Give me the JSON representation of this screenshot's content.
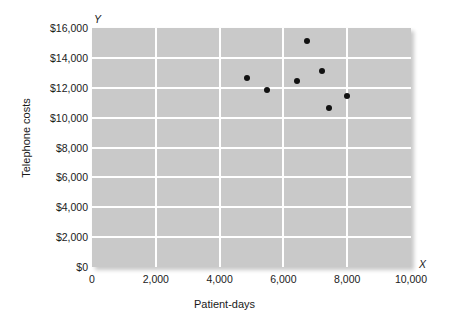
{
  "chart_data": {
    "type": "scatter",
    "title": "",
    "xlabel": "Patient-days",
    "ylabel": "Telephone costs",
    "x_axis_letter": "X",
    "y_axis_letter": "Y",
    "xlim": [
      0,
      10000
    ],
    "ylim": [
      0,
      16000
    ],
    "grid": true,
    "legend": null,
    "x_ticks": [
      0,
      2000,
      4000,
      6000,
      8000,
      10000
    ],
    "y_ticks": [
      0,
      2000,
      4000,
      6000,
      8000,
      10000,
      12000,
      14000,
      16000
    ],
    "x_tick_labels": [
      "0",
      "2,000",
      "4,000",
      "6,000",
      "8,000",
      "10,000"
    ],
    "y_tick_labels": [
      "$0",
      "$2,000",
      "$4,000",
      "$6,000",
      "$8,000",
      "$10,000",
      "$12,000",
      "$14,000",
      "$16,000"
    ],
    "points": [
      {
        "x": 4860,
        "y": 12650
      },
      {
        "x": 5490,
        "y": 11850
      },
      {
        "x": 6430,
        "y": 12450
      },
      {
        "x": 6740,
        "y": 15100
      },
      {
        "x": 7210,
        "y": 13150
      },
      {
        "x": 7430,
        "y": 10650
      },
      {
        "x": 8000,
        "y": 11450
      }
    ],
    "colors": {
      "plot_background": "#c9c9c9",
      "gridline": "#ffffff",
      "point": "#121212",
      "text": "#1a1a1a",
      "page_background": "#ffffff"
    }
  }
}
